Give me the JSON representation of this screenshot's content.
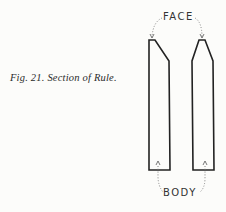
{
  "figure": {
    "caption": "Fig. 21. Section of Rule.",
    "labels": {
      "top": "FACE",
      "bottom": "BODY"
    },
    "line_color": "#222222",
    "dotted_color": "#777777",
    "background": "#fcfcfa"
  }
}
